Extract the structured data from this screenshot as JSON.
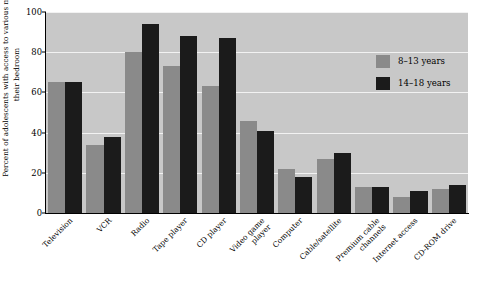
{
  "chart_data": {
    "type": "bar",
    "title": "",
    "xlabel": "",
    "ylabel": "Percent of adolescents with access to various media in their bedroom",
    "ylim": [
      0,
      100
    ],
    "yticks": [
      0,
      20,
      40,
      60,
      80,
      100
    ],
    "grid": true,
    "legend_position": "inside-top-right",
    "categories": [
      "Television",
      "VCR",
      "Radio",
      "Tape player",
      "CD player",
      "Video game\nplayer",
      "Computer",
      "Cable/satellite",
      "Premium cable\nchannels",
      "Internet access",
      "CD-ROM drive"
    ],
    "series": [
      {
        "name": "8–13 years",
        "color": "#8a8a8a",
        "values": [
          65,
          34,
          80,
          73,
          63,
          46,
          22,
          27,
          13,
          8,
          12
        ]
      },
      {
        "name": "14–18 years",
        "color": "#1b1b1b",
        "values": [
          65,
          38,
          94,
          88,
          87,
          41,
          18,
          30,
          13,
          11,
          14
        ]
      }
    ]
  },
  "axis": {
    "y_tick_labels": [
      "0",
      "20",
      "40",
      "60",
      "80",
      "100"
    ]
  },
  "colors": {
    "plot_background": "#c8c8c8",
    "gridline": "#f2f2f2",
    "series_a": "#8a8a8a",
    "series_b": "#1b1b1b",
    "axis": "#000000"
  }
}
